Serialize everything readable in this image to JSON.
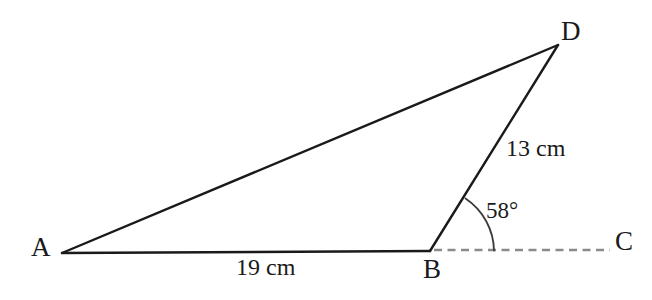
{
  "figure": {
    "type": "geometry-diagram",
    "background_color": "#ffffff",
    "stroke_color": "#1a1a1a",
    "dashed_stroke_color": "#8a8a8a",
    "canvas": {
      "width": 652,
      "height": 300
    },
    "vertices": [
      {
        "name": "A",
        "label": "A",
        "x": 62,
        "y": 253
      },
      {
        "name": "B",
        "label": "B",
        "x": 430,
        "y": 251
      },
      {
        "name": "C",
        "label": "C",
        "x": 610,
        "y": 250
      },
      {
        "name": "D",
        "label": "D",
        "x": 558,
        "y": 45
      }
    ],
    "segments": [
      {
        "name": "AD",
        "from": "A",
        "to": "D",
        "style": "solid",
        "x1": 62,
        "y1": 253,
        "x2": 558,
        "y2": 45
      },
      {
        "name": "AB",
        "from": "A",
        "to": "B",
        "style": "solid",
        "x1": 62,
        "y1": 253,
        "x2": 430,
        "y2": 251
      },
      {
        "name": "BD",
        "from": "B",
        "to": "D",
        "style": "solid",
        "x1": 430,
        "y1": 251,
        "x2": 558,
        "y2": 45
      },
      {
        "name": "BC",
        "from": "B",
        "to": "C",
        "style": "dashed",
        "x1": 434,
        "y1": 250,
        "x2": 610,
        "y2": 250
      }
    ],
    "angle_arc": {
      "name": "angle-DBC",
      "at_vertex": "B",
      "between": [
        "BD",
        "BC"
      ],
      "path": "M 465.5 198.5 A 64 64 0 0 1 494 250.5"
    },
    "labels": {
      "vertex_a": "A",
      "vertex_b": "B",
      "vertex_c": "C",
      "vertex_d": "D",
      "side_ab": "19 cm",
      "side_bd": "13 cm",
      "angle_b": "58°"
    },
    "measurements": [
      {
        "name": "side-ab",
        "segment": "AB",
        "value": 19,
        "unit": "cm",
        "text": "19 cm"
      },
      {
        "name": "side-bd",
        "segment": "BD",
        "value": 13,
        "unit": "cm",
        "text": "13 cm"
      },
      {
        "name": "angle-dbc",
        "vertex": "B",
        "value": 58,
        "unit": "degrees",
        "text": "58°"
      }
    ]
  }
}
